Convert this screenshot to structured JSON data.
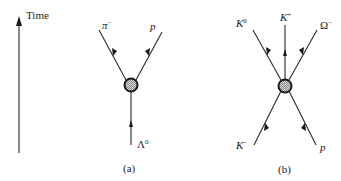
{
  "time_axis": {
    "label": "Time",
    "direction": "up"
  },
  "diagrams": [
    {
      "caption": "(a)",
      "incoming": [
        {
          "name": "Λ",
          "sup": "0"
        }
      ],
      "outgoing": [
        {
          "name": "π",
          "sup": "−"
        },
        {
          "name": "p",
          "sup": ""
        }
      ]
    },
    {
      "caption": "(b)",
      "incoming": [
        {
          "name": "K",
          "sup": "−"
        },
        {
          "name": "p",
          "sup": ""
        }
      ],
      "outgoing": [
        {
          "name": "K",
          "sup": "0"
        },
        {
          "name": "K",
          "sup": "+"
        },
        {
          "name": "Ω",
          "sup": "−"
        }
      ]
    }
  ],
  "colors": {
    "ink": "#1a1a1a",
    "background": "#ffffff",
    "vertex_fill": "#b0b0b0"
  }
}
